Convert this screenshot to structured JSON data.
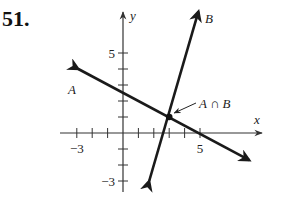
{
  "problem_number": "51.",
  "chart_data": {
    "type": "line",
    "title": "",
    "xlabel": "x",
    "ylabel": "y",
    "xlim": [
      -4,
      9
    ],
    "ylim": [
      -4,
      7.5
    ],
    "x_tick_labels": [
      {
        "value": -3,
        "label": "−3"
      },
      {
        "value": 5,
        "label": "5"
      }
    ],
    "y_tick_labels": [
      {
        "value": 5,
        "label": "5"
      },
      {
        "value": -3,
        "label": "−3"
      }
    ],
    "x_ticks": [
      -3,
      -2,
      -1,
      1,
      2,
      3,
      4,
      5
    ],
    "y_ticks": [
      -3,
      -2,
      -1,
      1,
      2,
      3,
      4,
      5
    ],
    "grid": false,
    "series": [
      {
        "name": "A",
        "points": [
          [
            -2.9,
            4.0
          ],
          [
            3,
            1
          ],
          [
            8.2,
            -1.7
          ]
        ]
      },
      {
        "name": "B",
        "points": [
          [
            1.7,
            -3.0
          ],
          [
            3,
            1
          ],
          [
            4.9,
            7.6
          ]
        ]
      }
    ],
    "annotations": [
      {
        "text": "A ∩ B",
        "point": [
          3,
          1
        ]
      },
      {
        "text": "A",
        "near_series": "A"
      },
      {
        "text": "B",
        "near_series": "B"
      }
    ]
  }
}
